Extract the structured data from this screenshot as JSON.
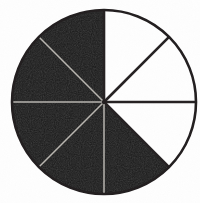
{
  "figure": {
    "name": "fraction-circle-diagram",
    "background_color": "#fefefe"
  },
  "chart_data": {
    "type": "pie",
    "title": "",
    "subtitle": "",
    "xlabel": "",
    "ylabel": "",
    "legend_position": "none",
    "grid": false,
    "total_sectors": 8,
    "shaded_sectors": 5,
    "unshaded_sectors": 3,
    "fraction_shaded": "5/8",
    "sector_angle_degrees": 45,
    "start_angle_degrees": 0,
    "direction": "clockwise",
    "categories": [
      "sector-1",
      "sector-2",
      "sector-3",
      "sector-4",
      "sector-5",
      "sector-6",
      "sector-7",
      "sector-8"
    ],
    "values": [
      45,
      45,
      45,
      45,
      45,
      45,
      45,
      45
    ],
    "slices": [
      {
        "index": 1,
        "start_deg": 0,
        "end_deg": 45,
        "state": "unshaded",
        "color": "#fefefe"
      },
      {
        "index": 2,
        "start_deg": 45,
        "end_deg": 90,
        "state": "unshaded",
        "color": "#fefefe"
      },
      {
        "index": 3,
        "start_deg": 90,
        "end_deg": 135,
        "state": "unshaded",
        "color": "#fefefe"
      },
      {
        "index": 4,
        "start_deg": 135,
        "end_deg": 180,
        "state": "shaded",
        "color": "#1a1a1a"
      },
      {
        "index": 5,
        "start_deg": 180,
        "end_deg": 225,
        "state": "shaded",
        "color": "#1a1a1a"
      },
      {
        "index": 6,
        "start_deg": 225,
        "end_deg": 270,
        "state": "shaded",
        "color": "#1a1a1a"
      },
      {
        "index": 7,
        "start_deg": 270,
        "end_deg": 315,
        "state": "shaded",
        "color": "#1a1a1a"
      },
      {
        "index": 8,
        "start_deg": 315,
        "end_deg": 360,
        "state": "shaded",
        "color": "#1a1a1a"
      }
    ],
    "geometry": {
      "center_x": 104,
      "center_y": 102,
      "radius": 92,
      "outline_width": 2.6
    },
    "colors": {
      "shaded_fill": "#1a1a1a",
      "unshaded_fill": "#fefefe",
      "outline": "#231f20",
      "divider_on_white": "#262223",
      "divider_on_black": "#b9b6b0"
    },
    "annotations": []
  }
}
